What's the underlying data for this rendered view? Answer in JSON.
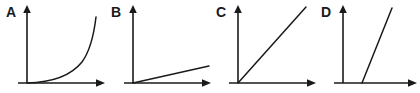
{
  "figure": {
    "background_color": "#ffffff",
    "stroke_color": "#1a1a1a",
    "width": 420,
    "height": 93
  },
  "panels": [
    {
      "label": "A",
      "label_x": 6,
      "label_y": 17,
      "origin_x": 27,
      "origin_y": 83,
      "y_axis_top": 6,
      "x_axis_end": 104,
      "x_axis_tick_left": 18,
      "curve_kind": "exponential-growth",
      "curve_description": "Curve starts at the origin, runs flat just above the x-axis, then bends sharply upward near the right edge",
      "curve_path": "M27,83 C50,82.4 70,77 82,62 C90,51 94,34 96,17",
      "curve_start": [
        27,
        83
      ],
      "curve_end": [
        96,
        17
      ]
    },
    {
      "label": "B",
      "label_x": 111,
      "label_y": 17,
      "origin_x": 133,
      "origin_y": 83,
      "y_axis_top": 6,
      "x_axis_end": 210,
      "x_axis_tick_left": 124,
      "curve_kind": "linear-shallow",
      "curve_description": "Straight line from the origin with a small positive slope, rising only slightly across the panel",
      "curve_path": "M133,83 L209,66",
      "curve_start": [
        133,
        83
      ],
      "curve_end": [
        209,
        66
      ]
    },
    {
      "label": "C",
      "label_x": 216,
      "label_y": 17,
      "origin_x": 238,
      "origin_y": 83,
      "y_axis_top": 6,
      "x_axis_end": 315,
      "x_axis_tick_left": 229,
      "curve_kind": "linear-steep-through-origin",
      "curve_description": "Straight line through the origin with a steep positive slope, about forty-five degrees, reaching the top right of the panel",
      "curve_path": "M238,83 L306,7",
      "curve_start": [
        238,
        83
      ],
      "curve_end": [
        306,
        7
      ]
    },
    {
      "label": "D",
      "label_x": 321,
      "label_y": 17,
      "origin_x": 343,
      "origin_y": 83,
      "y_axis_top": 6,
      "x_axis_end": 416,
      "x_axis_tick_left": 334,
      "curve_kind": "linear-steep-positive-intercept",
      "curve_description": "Very steep straight line that crosses the x-axis to the right of the origin rather than passing through it",
      "curve_path": "M362,83 L392,8",
      "curve_start": [
        362,
        83
      ],
      "curve_end": [
        392,
        8
      ]
    }
  ]
}
